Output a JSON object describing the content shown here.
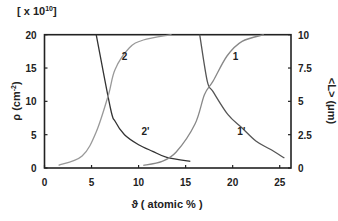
{
  "chart_data": {
    "type": "line",
    "title": "",
    "multiplier_label": "[ x 10",
    "multiplier_exp": "10",
    "multiplier_close": "]",
    "xlabel": "ϑ ( atomic % )",
    "ylabel": "ρ (cm",
    "ylabel_exp": "-2",
    "ylabel_close": ")",
    "y2label": "<L> (μm)",
    "xlim": [
      0,
      26.2
    ],
    "ylim": [
      0,
      20
    ],
    "y2lim": [
      0,
      10
    ],
    "x_ticks": [
      "0",
      "5",
      "10",
      "15",
      "20",
      "25"
    ],
    "y_ticks": [
      "0",
      "5",
      "10",
      "15",
      "20"
    ],
    "y2_ticks": [
      "0",
      "2.5",
      "5",
      "7.5",
      "10"
    ],
    "grid": false,
    "series": [
      {
        "name": "2'",
        "axis": "left",
        "color": "#333333",
        "x": [
          5.5,
          7.0,
          7.5,
          8.5,
          10.0,
          11.5,
          13.0,
          15.5
        ],
        "y": [
          20,
          9,
          7,
          5,
          3.5,
          2.5,
          1.6,
          1.0
        ]
      },
      {
        "name": "2",
        "axis": "right",
        "color": "#999999",
        "x": [
          1.5,
          4.0,
          5.5,
          6.8,
          7.5,
          9.0,
          10.5,
          13.5
        ],
        "y": [
          0.2,
          0.9,
          2.7,
          5.5,
          7.4,
          9.0,
          9.6,
          10
        ]
      },
      {
        "name": "1'",
        "axis": "left",
        "color": "#555555",
        "x": [
          16.5,
          17.3,
          17.9,
          19.5,
          21.0,
          22.5,
          24.0,
          25.5
        ],
        "y": [
          20,
          13,
          11.5,
          8,
          6,
          4,
          2.8,
          1.5
        ]
      },
      {
        "name": "1",
        "axis": "right",
        "color": "#888888",
        "x": [
          10.5,
          12.5,
          14.0,
          16.0,
          17.0,
          17.9,
          19.4,
          21.0,
          23.3
        ],
        "y": [
          0.2,
          0.5,
          1.2,
          3.3,
          5.5,
          6.5,
          8.4,
          9.5,
          10
        ]
      }
    ],
    "annotations": [
      {
        "text": "2",
        "x": 8.2,
        "y": 16.2
      },
      {
        "text": "2'",
        "x": 10.3,
        "y": 5.0
      },
      {
        "text": "1",
        "x": 20.0,
        "y": 16.2
      },
      {
        "text": "1'",
        "x": 20.5,
        "y": 5.0
      }
    ],
    "legend": "none"
  }
}
